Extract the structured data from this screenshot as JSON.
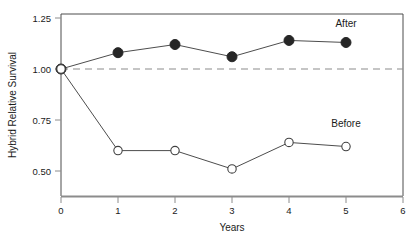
{
  "chart_data": {
    "type": "line",
    "title": "",
    "xlabel": "Years",
    "ylabel": "Hybrid Relative Survival",
    "xlim": [
      0,
      6
    ],
    "ylim": [
      0.4375,
      1.3
    ],
    "x": [
      0,
      1,
      2,
      3,
      4,
      5
    ],
    "xticks": [
      0,
      1,
      2,
      3,
      4,
      5,
      6
    ],
    "xtick_labels": [
      "0",
      "1",
      "2",
      "3",
      "4",
      "5",
      "6"
    ],
    "yticks": [
      0.5,
      0.75,
      1.0,
      1.25
    ],
    "ytick_labels": [
      "0.50",
      "0.75",
      "1.00",
      "1.25"
    ],
    "grid": false,
    "legend_position": "inline-end-of-line",
    "reference_line": {
      "value": 1.0,
      "style": "dashed",
      "color": "#8c8c8c"
    },
    "series": [
      {
        "name": "After",
        "marker": "filled-circle",
        "color": "#262626",
        "values": [
          1.0,
          1.08,
          1.12,
          1.06,
          1.14,
          1.13
        ],
        "label_text": "After"
      },
      {
        "name": "Before",
        "marker": "open-circle",
        "color": "#404040",
        "values": [
          1.0,
          0.6,
          0.6,
          0.51,
          0.64,
          0.62
        ],
        "label_text": "Before"
      }
    ],
    "annotations": [
      {
        "text": "After",
        "x": 5.0,
        "y": 1.205
      },
      {
        "text": "Before",
        "x": 5.0,
        "y": 0.715
      }
    ],
    "colors": {
      "frame": "#4d4d4d",
      "axis": "#808080",
      "line": "#4d4d4d",
      "marker_fill": "#262626",
      "marker_open_fill": "#ffffff",
      "reference": "#8c8c8c",
      "text": "#1a1a1a",
      "background": "#ffffff"
    }
  }
}
